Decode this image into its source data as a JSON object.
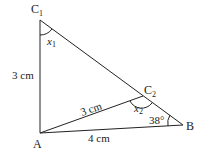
{
  "diagram": {
    "type": "triangle-ambiguous-case",
    "vertices": {
      "A": {
        "label": "A",
        "x": 40,
        "y": 133
      },
      "B": {
        "label": "B",
        "x": 183,
        "y": 125
      },
      "C1": {
        "label": "C",
        "sub": "1",
        "x": 40,
        "y": 20
      },
      "C2": {
        "label": "C",
        "sub": "2",
        "x": 143,
        "y": 96
      }
    },
    "labels": {
      "side_AC1": "3 cm",
      "side_AC2": "3 cm",
      "side_AB": "4 cm",
      "angle_B": "38°",
      "angle_x1": "x",
      "angle_x1_sub": "1",
      "angle_x2": "x",
      "angle_x2_sub": "2"
    },
    "stroke_color": "#222222"
  }
}
